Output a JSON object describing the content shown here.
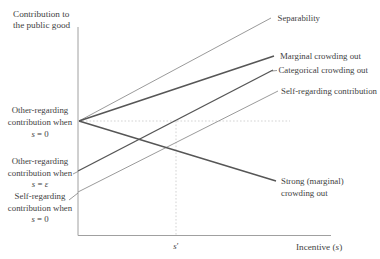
{
  "figure": {
    "width": 380,
    "height": 259,
    "background": "#ffffff"
  },
  "colors": {
    "axis": "#a0a0a0",
    "line_dark": "#565656",
    "line_light": "#8e8e8e",
    "dotted": "#c8c8c8",
    "leader": "#6f6f6f",
    "text": "#3f3f3f"
  },
  "chart_data": {
    "type": "line",
    "title": "",
    "ylabel": "Contribution to the public good",
    "xlabel": "Incentive (s)",
    "axis_numeric": false,
    "x_tick_labels": [
      "s′"
    ],
    "axes_px": {
      "y_axis": {
        "x1": 78,
        "y1": 27,
        "x2": 78,
        "y2": 235.5
      },
      "x_axis": {
        "x1": 78,
        "y1": 235.5,
        "x2": 331,
        "y2": 235.5
      }
    },
    "series": [
      {
        "name": "separability",
        "label": "Separability",
        "x1": 79,
        "y1": 121,
        "x2": 271,
        "y2": 18,
        "tone": "light",
        "w": 0.9
      },
      {
        "name": "marginal-crowding-out",
        "label": "Marginal crowding out",
        "x1": 79,
        "y1": 121,
        "x2": 274,
        "y2": 56,
        "tone": "dark",
        "w": 1.4
      },
      {
        "name": "categorical-crowding-out",
        "label": "Categorical crowding out",
        "x1": 78,
        "y1": 171,
        "x2": 273,
        "y2": 70,
        "tone": "dark",
        "w": 1.4
      },
      {
        "name": "self-regarding-contribution",
        "label": "Self-regarding contribution",
        "x1": 78,
        "y1": 192,
        "x2": 278,
        "y2": 91,
        "tone": "light",
        "w": 0.9
      },
      {
        "name": "strong-marginal-crowding-out",
        "label": "Strong (marginal) crowding out",
        "x1": 79,
        "y1": 121,
        "x2": 276,
        "y2": 181,
        "tone": "dark",
        "w": 1.4
      }
    ],
    "guides": [
      {
        "name": "dotted-horizontal-s0-level",
        "x1": 79,
        "y1": 121,
        "x2": 290,
        "y2": 121
      },
      {
        "name": "dotted-vertical-s-prime",
        "x1": 176,
        "y1": 121,
        "x2": 176,
        "y2": 235
      }
    ],
    "leaders": [
      {
        "name": "leader-other-regarding-eps",
        "x1": 73,
        "y1": 174,
        "x2": 78,
        "y2": 171.5
      },
      {
        "name": "leader-self-regarding-s0",
        "x1": 69,
        "y1": 200,
        "x2": 78,
        "y2": 193
      },
      {
        "name": "leader-categorical",
        "x1": 272,
        "y1": 71,
        "x2": 277,
        "y2": 70.5
      }
    ],
    "labels": [
      {
        "name": "y-axis-title-line-1",
        "x": 13,
        "y": 16.5,
        "anchor": "start",
        "cls": "axlbl",
        "parts": [
          {
            "t": "Contribution to"
          }
        ]
      },
      {
        "name": "y-axis-title-line-2",
        "x": 13,
        "y": 28,
        "anchor": "start",
        "cls": "axlbl",
        "parts": [
          {
            "t": "the public good"
          }
        ]
      },
      {
        "name": "annotation-other-regarding-s0-line-1",
        "x": 40,
        "y": 113,
        "anchor": "middle",
        "cls": "lbl",
        "parts": [
          {
            "t": "Other-regarding"
          }
        ]
      },
      {
        "name": "annotation-other-regarding-s0-line-2",
        "x": 40,
        "y": 125,
        "anchor": "middle",
        "cls": "lbl",
        "parts": [
          {
            "t": "contribution when"
          }
        ]
      },
      {
        "name": "annotation-other-regarding-s0-line-3",
        "x": 40,
        "y": 136.5,
        "anchor": "middle",
        "cls": "lbl",
        "parts": [
          {
            "t": "s",
            "i": true
          },
          {
            "t": " = 0"
          }
        ]
      },
      {
        "name": "annotation-other-regarding-eps-line-1",
        "x": 40,
        "y": 163.5,
        "anchor": "middle",
        "cls": "lbl",
        "parts": [
          {
            "t": "Other-regarding"
          }
        ]
      },
      {
        "name": "annotation-other-regarding-eps-line-2",
        "x": 40,
        "y": 175.5,
        "anchor": "middle",
        "cls": "lbl",
        "parts": [
          {
            "t": "contribution when"
          }
        ]
      },
      {
        "name": "annotation-other-regarding-eps-line-3",
        "x": 40,
        "y": 187,
        "anchor": "middle",
        "cls": "lbl",
        "parts": [
          {
            "t": "s",
            "i": true
          },
          {
            "t": " = "
          },
          {
            "t": "ε",
            "i": true
          }
        ]
      },
      {
        "name": "annotation-self-regarding-s0-line-1",
        "x": 40,
        "y": 198.5,
        "anchor": "middle",
        "cls": "lbl",
        "parts": [
          {
            "t": "Self-regarding"
          }
        ]
      },
      {
        "name": "annotation-self-regarding-s0-line-2",
        "x": 40,
        "y": 210.5,
        "anchor": "middle",
        "cls": "lbl",
        "parts": [
          {
            "t": "contribution when"
          }
        ]
      },
      {
        "name": "annotation-self-regarding-s0-line-3",
        "x": 40,
        "y": 221.5,
        "anchor": "middle",
        "cls": "lbl",
        "parts": [
          {
            "t": "s",
            "i": true
          },
          {
            "t": " = 0"
          }
        ]
      },
      {
        "name": "label-separability",
        "x": 277.5,
        "y": 21,
        "anchor": "start",
        "cls": "lbl",
        "parts": [
          {
            "t": "Separability"
          }
        ]
      },
      {
        "name": "label-marginal-crowding-out",
        "x": 280,
        "y": 59,
        "anchor": "start",
        "cls": "lbl",
        "parts": [
          {
            "t": "Marginal crowding out"
          }
        ]
      },
      {
        "name": "label-categorical-crowding-out",
        "x": 278.5,
        "y": 73,
        "anchor": "start",
        "cls": "lbl",
        "parts": [
          {
            "t": "Categorical crowding out"
          }
        ]
      },
      {
        "name": "label-self-regarding-contribution",
        "x": 281,
        "y": 94,
        "anchor": "start",
        "cls": "lbl",
        "parts": [
          {
            "t": "Self-regarding contribution"
          }
        ]
      },
      {
        "name": "label-strong-crowding-out-line-1",
        "x": 281,
        "y": 183.5,
        "anchor": "start",
        "cls": "lbl",
        "parts": [
          {
            "t": "Strong (marginal)"
          }
        ]
      },
      {
        "name": "label-strong-crowding-out-line-2",
        "x": 281,
        "y": 195.5,
        "anchor": "start",
        "cls": "lbl",
        "parts": [
          {
            "t": "crowding out"
          }
        ]
      },
      {
        "name": "x-tick-s-prime",
        "x": 176,
        "y": 248.5,
        "anchor": "middle",
        "cls": "lbl",
        "parts": [
          {
            "t": "s",
            "i": true
          },
          {
            "t": "′"
          }
        ]
      },
      {
        "name": "x-axis-label",
        "x": 296,
        "y": 250,
        "anchor": "start",
        "cls": "axlbl",
        "parts": [
          {
            "t": "Incentive ("
          },
          {
            "t": "s",
            "i": true
          },
          {
            "t": ")"
          }
        ]
      }
    ]
  }
}
